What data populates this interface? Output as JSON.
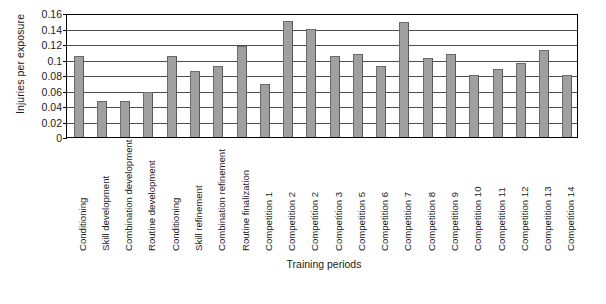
{
  "chart_data": {
    "type": "bar",
    "title": "",
    "xlabel": "Training periods",
    "ylabel": "Injuries per exposure",
    "ylim": [
      0,
      0.16
    ],
    "ytick_labels": [
      "0.16",
      "0.14",
      "0.12",
      "0.1",
      "0.08",
      "0.06",
      "0.04",
      "0.02",
      "0"
    ],
    "ytick_values": [
      0.16,
      0.14,
      0.12,
      0.1,
      0.08,
      0.06,
      0.04,
      0.02,
      0
    ],
    "grid": true,
    "legend": false,
    "bar_color": "#a0a0a0",
    "bar_edge_color": "#6b6b6b",
    "categories": [
      "Conditioning",
      "Skill development",
      "Combination development",
      "Routine development",
      "Conditioning",
      "Skill refinement",
      "Combination refinement",
      "Routine finalization",
      "Competition 1",
      "Competition 2",
      "Competition 2",
      "Competition 3",
      "Competition 5",
      "Competition 6",
      "Competition 7",
      "Competition 8",
      "Competition 9",
      "Competition 10",
      "Competition 11",
      "Competition 12",
      "Competition 13",
      "Competition 14"
    ],
    "values": [
      0.105,
      0.047,
      0.047,
      0.058,
      0.105,
      0.085,
      0.092,
      0.118,
      0.068,
      0.15,
      0.14,
      0.105,
      0.107,
      0.092,
      0.148,
      0.102,
      0.107,
      0.08,
      0.088,
      0.095,
      0.112,
      0.08
    ]
  }
}
